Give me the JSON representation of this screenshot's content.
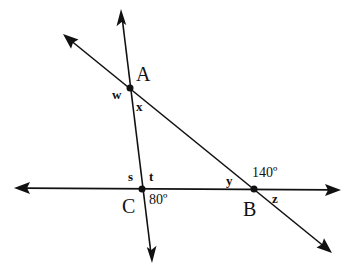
{
  "diagram": {
    "type": "geometry-intersecting-lines",
    "points": [
      {
        "name": "A",
        "x": 130,
        "y": 88
      },
      {
        "name": "B",
        "x": 254,
        "y": 189
      },
      {
        "name": "C",
        "x": 142,
        "y": 189
      }
    ],
    "labels": {
      "A": "A",
      "B": "B",
      "C": "C",
      "w": "w",
      "x": "x",
      "s": "s",
      "t": "t",
      "y": "y",
      "z": "z",
      "angle_C": "80º",
      "angle_B": "140º"
    },
    "lines": [
      {
        "name": "horizontal-line-CB",
        "from": [
          14,
          188
        ],
        "to": [
          341,
          190
        ]
      },
      {
        "name": "line-AC",
        "from": [
          121,
          10
        ],
        "to": [
          152,
          262
        ]
      },
      {
        "name": "line-AB",
        "from": [
          64,
          35
        ],
        "to": [
          331,
          252
        ]
      }
    ],
    "colors": {
      "ink": "#111111",
      "background": "#ffffff"
    }
  }
}
